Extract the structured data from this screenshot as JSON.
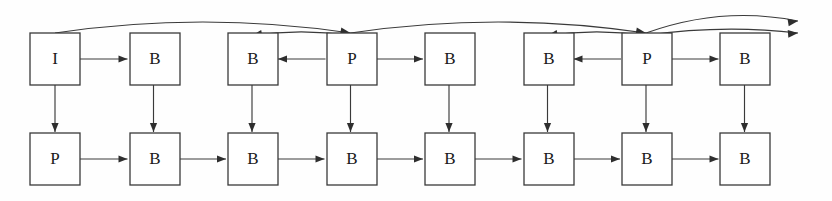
{
  "diagram": {
    "kind": "frame-dependency-graph",
    "canvas": {
      "width": 832,
      "height": 201
    },
    "colors": {
      "background": "#fefefe",
      "box_stroke": "#3a3a3a",
      "box_fill": "#ffffff",
      "edge": "#3a3a3a",
      "arrow": "#2e2e2e",
      "label": "#1a1a1a"
    },
    "geometry": {
      "box_width": 50,
      "box_height": 52,
      "column_pitch": 98.5,
      "first_column_x": 30,
      "top_row_y": 33,
      "bottom_row_y": 133
    },
    "rows": [
      {
        "name": "top-row",
        "y": 33,
        "nodes": [
          {
            "label": "I",
            "x": 30,
            "column": 0
          },
          {
            "label": "B",
            "x": 130,
            "column": 1
          },
          {
            "label": "B",
            "x": 228,
            "column": 2
          },
          {
            "label": "P",
            "x": 327,
            "column": 3
          },
          {
            "label": "B",
            "x": 425,
            "column": 4
          },
          {
            "label": "B",
            "x": 524,
            "column": 5
          },
          {
            "label": "P",
            "x": 622,
            "column": 6
          },
          {
            "label": "B",
            "x": 720,
            "column": 7
          }
        ]
      },
      {
        "name": "bottom-row",
        "y": 133,
        "nodes": [
          {
            "label": "P",
            "x": 30,
            "column": 0
          },
          {
            "label": "B",
            "x": 130,
            "column": 1
          },
          {
            "label": "B",
            "x": 228,
            "column": 2
          },
          {
            "label": "B",
            "x": 327,
            "column": 3
          },
          {
            "label": "B",
            "x": 425,
            "column": 4
          },
          {
            "label": "B",
            "x": 524,
            "column": 5
          },
          {
            "label": "B",
            "x": 622,
            "column": 6
          },
          {
            "label": "B",
            "x": 720,
            "column": 7
          }
        ]
      }
    ],
    "horizontal_edges_top": [
      {
        "from_column": 0,
        "to_column": 1,
        "direction": "right"
      },
      {
        "from_column": 3,
        "to_column": 2,
        "direction": "left"
      },
      {
        "from_column": 3,
        "to_column": 4,
        "direction": "right"
      },
      {
        "from_column": 6,
        "to_column": 5,
        "direction": "left"
      },
      {
        "from_column": 6,
        "to_column": 7,
        "direction": "right"
      }
    ],
    "horizontal_edges_bottom": [
      {
        "from_column": 0,
        "to_column": 1,
        "direction": "right"
      },
      {
        "from_column": 1,
        "to_column": 2,
        "direction": "right"
      },
      {
        "from_column": 2,
        "to_column": 3,
        "direction": "right"
      },
      {
        "from_column": 3,
        "to_column": 4,
        "direction": "right"
      },
      {
        "from_column": 4,
        "to_column": 5,
        "direction": "right"
      },
      {
        "from_column": 5,
        "to_column": 6,
        "direction": "right"
      },
      {
        "from_column": 6,
        "to_column": 7,
        "direction": "right"
      }
    ],
    "vertical_edges": [
      {
        "column": 0,
        "direction": "down"
      },
      {
        "column": 1,
        "direction": "down"
      },
      {
        "column": 2,
        "direction": "down"
      },
      {
        "column": 3,
        "direction": "down"
      },
      {
        "column": 4,
        "direction": "down"
      },
      {
        "column": 5,
        "direction": "down"
      },
      {
        "column": 6,
        "direction": "down"
      },
      {
        "column": 7,
        "direction": "down"
      }
    ],
    "arcs": [
      {
        "name": "arc-i-to-p1",
        "from_column": 0,
        "to_column": 3,
        "direction": "right",
        "lane": 0
      },
      {
        "name": "arc-p1-to-b2",
        "from_column": 3,
        "to_column": 2,
        "direction": "left",
        "lane": 1
      },
      {
        "name": "arc-p1-to-p2",
        "from_column": 3,
        "to_column": 6,
        "direction": "right",
        "lane": 0
      },
      {
        "name": "arc-p2-to-b5",
        "from_column": 6,
        "to_column": 5,
        "direction": "left",
        "lane": 1
      },
      {
        "name": "arc-p2-to-right-a",
        "from_column": 6,
        "to_column": 8,
        "direction": "right",
        "lane": 0
      },
      {
        "name": "arc-p2-to-right-b",
        "from_column": 6,
        "to_column": 8,
        "direction": "right",
        "lane": 1
      }
    ]
  }
}
